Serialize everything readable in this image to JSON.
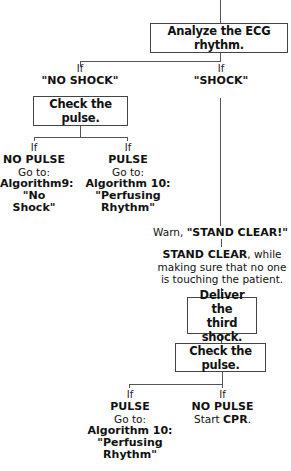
{
  "flowchart": {
    "analyze_box": "Analyze the ECG rhythm.",
    "branch_no_shock": {
      "if": "If",
      "condition": "\"NO SHOCK\""
    },
    "branch_shock": {
      "if": "If",
      "condition": "\"SHOCK\""
    },
    "check_pulse_1": "Check the pulse.",
    "no_pulse_1": {
      "if": "If",
      "condition": "NO PULSE",
      "goto": "Go to:",
      "algorithm": "Algorithm9:",
      "algorithm_name": "\"No Shock\""
    },
    "pulse_1": {
      "if": "If",
      "condition": "PULSE",
      "goto": "Go to:",
      "algorithm": "Algorithm 10:",
      "algorithm_name": "\"Perfusing Rhythm\""
    },
    "warn": {
      "prefix": "Warn, ",
      "emphasis": "\"STAND CLEAR!\""
    },
    "stand_clear": {
      "emphasis": "STAND CLEAR",
      "rest_line1": ", while",
      "line2": "making sure that no one",
      "line3": "is touching the patient."
    },
    "deliver_box": {
      "line1": "Deliver the",
      "line2": "third shock."
    },
    "check_pulse_2": "Check the pulse.",
    "pulse_2": {
      "if": "If",
      "condition": "PULSE",
      "goto": "Go to:",
      "algorithm": "Algorithm 10:",
      "algorithm_name": "\"Perfusing Rhythm\""
    },
    "no_pulse_2": {
      "if": "If",
      "condition": "NO PULSE",
      "action_prefix": "Start ",
      "action_emphasis": "CPR",
      "action_suffix": "."
    }
  }
}
